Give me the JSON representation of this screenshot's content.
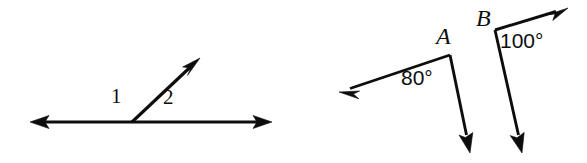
{
  "figure": {
    "background_color": "#ffffff",
    "ink_color": "#0d0d0d"
  },
  "left_figure": {
    "name": "linear-pair-figure",
    "description": "A straight line with a ray from its midpoint forming two adjacent angles",
    "labels": {
      "angle_1": "1",
      "angle_2": "2"
    },
    "vertex": {
      "x": 132,
      "y": 122
    },
    "rays": [
      {
        "name": "ray-left",
        "to": {
          "x": 30,
          "y": 122
        },
        "arrow": true
      },
      {
        "name": "ray-right",
        "to": {
          "x": 272,
          "y": 122
        },
        "arrow": true
      },
      {
        "name": "ray-diagonal",
        "to": {
          "x": 200,
          "y": 58
        },
        "arrow": true
      }
    ]
  },
  "right_figure": {
    "name": "angles-a-and-b-figure",
    "description": "Two separate angles labeled A and B with measures 80 degrees and 100 degrees",
    "angle_a": {
      "vertex_label": "A",
      "measure_label": "80°",
      "measure_value": 80,
      "unit": "degrees",
      "vertex": {
        "x": 450,
        "y": 55
      },
      "rays": [
        {
          "name": "ray-a-left",
          "to": {
            "x": 339,
            "y": 92
          },
          "arrow": true
        },
        {
          "name": "ray-a-down",
          "to": {
            "x": 470,
            "y": 153
          },
          "arrow": true
        }
      ]
    },
    "angle_b": {
      "vertex_label": "B",
      "measure_label": "100°",
      "measure_value": 100,
      "unit": "degrees",
      "vertex": {
        "x": 495,
        "y": 30
      },
      "rays": [
        {
          "name": "ray-b-upright",
          "to": {
            "x": 568,
            "y": 8
          },
          "arrow": true
        },
        {
          "name": "ray-b-down",
          "to": {
            "x": 522,
            "y": 153
          },
          "arrow": true
        }
      ]
    }
  }
}
